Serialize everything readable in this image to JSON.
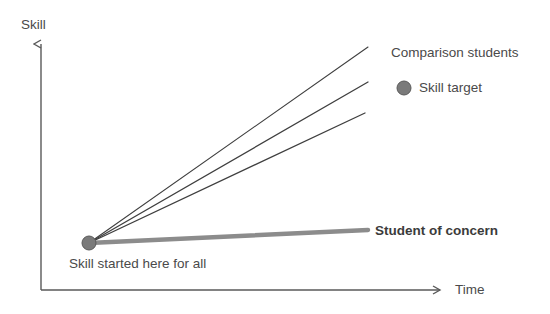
{
  "figure": {
    "title_visible": false,
    "background_color": "#ffffff"
  },
  "axes": {
    "y": {
      "label": "Skill",
      "color": "#595959",
      "origin_x": 41,
      "top_y": 41,
      "bottom_y": 290
    },
    "x": {
      "label": "Time",
      "color": "#595959",
      "left_x": 41,
      "right_x": 443,
      "y": 290
    }
  },
  "origin_marker": {
    "name": "skill-start-dot",
    "x": 89,
    "y": 243,
    "radius": 7,
    "fill_color": "#7a7a7a",
    "stroke_color": "#5a5a5a",
    "caption": "Skill started here for all"
  },
  "legend": {
    "comparison_label": "Comparison students",
    "target_label": "Skill target",
    "target_dot": {
      "x": 404,
      "y": 88,
      "radius": 7,
      "fill_color": "#7a7a7a",
      "stroke_color": "#5a5a5a"
    }
  },
  "annotations": {
    "student_of_concern": "Student of concern"
  },
  "chart_data": {
    "type": "line",
    "title": "",
    "xlabel": "Time",
    "ylabel": "Skill",
    "grid": false,
    "legend_position": "right",
    "axis_note": "Unitless conceptual axes; no tick marks or numeric scale shown",
    "common_start_point": {
      "x": 89,
      "y": 243
    },
    "series": [
      {
        "name": "Comparison student 1",
        "style": "thin-dark",
        "color": "#3f3f3f",
        "width": 1.1,
        "points": [
          {
            "x": 89,
            "y": 243
          },
          {
            "x": 368,
            "y": 47
          }
        ]
      },
      {
        "name": "Comparison student 2",
        "style": "thin-dark",
        "color": "#3f3f3f",
        "width": 1.3,
        "points": [
          {
            "x": 89,
            "y": 243
          },
          {
            "x": 368,
            "y": 82
          }
        ]
      },
      {
        "name": "Comparison student 3",
        "style": "thin-dark",
        "color": "#3f3f3f",
        "width": 1.3,
        "points": [
          {
            "x": 89,
            "y": 243
          },
          {
            "x": 365,
            "y": 113
          }
        ]
      },
      {
        "name": "Student of concern",
        "style": "thick-gray",
        "color": "#8c8c8c",
        "width": 4.5,
        "points": [
          {
            "x": 89,
            "y": 243
          },
          {
            "x": 368,
            "y": 230
          }
        ]
      }
    ]
  }
}
